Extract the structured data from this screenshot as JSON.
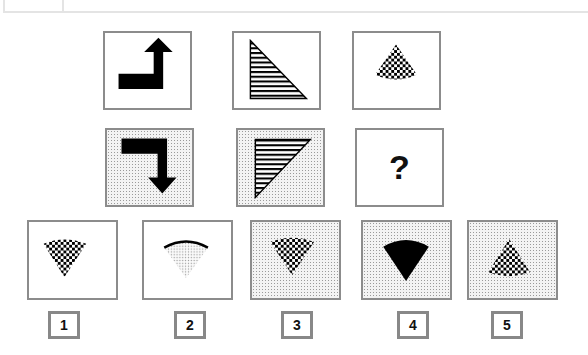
{
  "puzzle": {
    "grid": [
      [
        {
          "id": "r1c1",
          "background": "white",
          "figure": "arrow-bent-up",
          "fill": "solid-black"
        },
        {
          "id": "r1c2",
          "background": "white",
          "figure": "right-triangle-bottom-left",
          "fill": "horizontal-stripes"
        },
        {
          "id": "r1c3",
          "background": "white",
          "figure": "sector-pointing-up",
          "fill": "checkerboard"
        }
      ],
      [
        {
          "id": "r2c1",
          "background": "dotted",
          "figure": "arrow-bent-down",
          "fill": "solid-black"
        },
        {
          "id": "r2c2",
          "background": "dotted",
          "figure": "right-triangle-top-left",
          "fill": "horizontal-stripes"
        },
        {
          "id": "r2c3",
          "background": "white",
          "figure": "question-mark",
          "text": "?"
        }
      ]
    ],
    "options": [
      {
        "label": "1",
        "background": "white",
        "figure": "sector-pointing-down",
        "fill": "checkerboard"
      },
      {
        "label": "2",
        "background": "white",
        "figure": "sector-pointing-down-arc",
        "fill": "dotted"
      },
      {
        "label": "3",
        "background": "dotted",
        "figure": "sector-pointing-down",
        "fill": "checkerboard"
      },
      {
        "label": "4",
        "background": "dotted",
        "figure": "sector-pointing-down",
        "fill": "solid-black"
      },
      {
        "label": "5",
        "background": "dotted",
        "figure": "sector-pointing-up",
        "fill": "checkerboard"
      }
    ]
  },
  "colors": {
    "border": "#8c8c8c",
    "figure": "#000000",
    "dotted_bg": "#f3f3f3"
  }
}
